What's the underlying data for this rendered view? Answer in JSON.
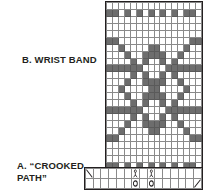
{
  "figures": {
    "wrist_band": {
      "label": "B. WRIST BAND",
      "chart": {
        "type": "beadwork-grid",
        "cols": 16,
        "rows": 25,
        "fill_color": "#6d6d6d",
        "empty_color": "#ffffff",
        "grid_line_color": "#8a8a8a",
        "border_color": "#231f20",
        "legend": "1 = filled bead, 0 = empty bead",
        "cells": [
          [
            0,
            0,
            0,
            0,
            0,
            0,
            0,
            0,
            0,
            0,
            0,
            0,
            0,
            0,
            0,
            0
          ],
          [
            1,
            1,
            0,
            1,
            0,
            1,
            0,
            1,
            0,
            1,
            0,
            1,
            0,
            1,
            1,
            0
          ],
          [
            0,
            0,
            0,
            0,
            0,
            0,
            0,
            0,
            0,
            0,
            0,
            0,
            0,
            0,
            0,
            0
          ],
          [
            0,
            0,
            0,
            0,
            0,
            0,
            0,
            0,
            0,
            0,
            0,
            0,
            0,
            0,
            0,
            0
          ],
          [
            0,
            0,
            0,
            0,
            0,
            0,
            0,
            0,
            0,
            0,
            0,
            0,
            0,
            0,
            0,
            0
          ],
          [
            1,
            1,
            0,
            0,
            0,
            0,
            0,
            0,
            0,
            0,
            0,
            0,
            0,
            0,
            1,
            1
          ],
          [
            0,
            0,
            1,
            0,
            0,
            0,
            0,
            1,
            1,
            0,
            0,
            0,
            0,
            1,
            0,
            0
          ],
          [
            0,
            0,
            0,
            1,
            0,
            0,
            1,
            1,
            1,
            1,
            0,
            0,
            1,
            0,
            0,
            0
          ],
          [
            0,
            0,
            0,
            0,
            1,
            0,
            1,
            0,
            0,
            1,
            0,
            1,
            0,
            0,
            0,
            0
          ],
          [
            1,
            1,
            1,
            1,
            1,
            1,
            0,
            0,
            0,
            0,
            1,
            1,
            1,
            1,
            1,
            1
          ],
          [
            0,
            0,
            0,
            0,
            1,
            0,
            1,
            0,
            0,
            1,
            0,
            1,
            0,
            0,
            0,
            0
          ],
          [
            0,
            0,
            0,
            1,
            0,
            0,
            1,
            1,
            1,
            1,
            0,
            0,
            1,
            0,
            0,
            0
          ],
          [
            0,
            0,
            1,
            0,
            0,
            0,
            0,
            1,
            1,
            0,
            0,
            0,
            0,
            1,
            0,
            0
          ],
          [
            0,
            0,
            0,
            1,
            0,
            0,
            1,
            1,
            1,
            1,
            0,
            0,
            1,
            0,
            0,
            0
          ],
          [
            0,
            0,
            0,
            0,
            1,
            0,
            1,
            0,
            0,
            1,
            0,
            1,
            0,
            0,
            0,
            0
          ],
          [
            1,
            1,
            1,
            1,
            1,
            1,
            0,
            0,
            0,
            0,
            1,
            1,
            1,
            1,
            1,
            1
          ],
          [
            0,
            0,
            0,
            0,
            1,
            0,
            1,
            0,
            0,
            1,
            0,
            1,
            0,
            0,
            0,
            0
          ],
          [
            0,
            0,
            0,
            1,
            0,
            0,
            1,
            1,
            1,
            1,
            0,
            0,
            1,
            0,
            0,
            0
          ],
          [
            0,
            0,
            1,
            0,
            0,
            0,
            0,
            1,
            1,
            0,
            0,
            0,
            0,
            1,
            0,
            0
          ],
          [
            1,
            1,
            0,
            0,
            0,
            0,
            0,
            0,
            0,
            0,
            0,
            0,
            0,
            0,
            1,
            1
          ],
          [
            0,
            0,
            0,
            0,
            0,
            0,
            0,
            0,
            0,
            0,
            0,
            0,
            0,
            0,
            0,
            0
          ],
          [
            0,
            0,
            0,
            0,
            0,
            0,
            0,
            0,
            0,
            0,
            0,
            0,
            0,
            0,
            0,
            0
          ],
          [
            0,
            0,
            0,
            0,
            0,
            0,
            0,
            0,
            0,
            0,
            0,
            0,
            0,
            0,
            0,
            0
          ],
          [
            1,
            1,
            0,
            1,
            0,
            1,
            0,
            1,
            0,
            1,
            0,
            1,
            0,
            1,
            1,
            0
          ],
          [
            0,
            0,
            0,
            0,
            0,
            0,
            0,
            0,
            0,
            0,
            0,
            0,
            0,
            0,
            0,
            0
          ]
        ]
      }
    },
    "crooked_path": {
      "label_line1": "A. “CROOKED",
      "label_line2": "PATH”",
      "chart": {
        "type": "beadwork-grid",
        "cols": 15,
        "rows": 2,
        "grid_line_color": "#8a8a8a",
        "border_color": "#231f20",
        "marks": [
          {
            "row": 0,
            "col": 0,
            "glyph": "diagonal-down"
          },
          {
            "row": 0,
            "col": 6,
            "glyph": "bead-figure"
          },
          {
            "row": 0,
            "col": 8,
            "glyph": "bead-figure"
          },
          {
            "row": 1,
            "col": 6,
            "glyph": "circle"
          },
          {
            "row": 1,
            "col": 8,
            "glyph": "circle"
          },
          {
            "row": 1,
            "col": 14,
            "glyph": "diagonal-up"
          }
        ]
      }
    }
  }
}
